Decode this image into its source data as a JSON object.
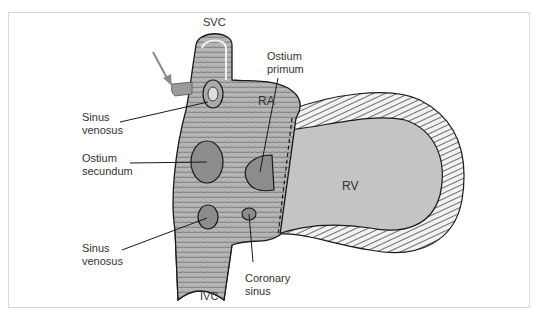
{
  "figure": {
    "colors": {
      "wall": "#b8b8b8",
      "wall_dark": "#9a9a9a",
      "rv": "#c4c4c4",
      "ostium": "#8c8c8c",
      "outline": "#1a1a1a",
      "arrow": "#8a8a8a",
      "frame": "#d8d8d8"
    }
  },
  "labels": {
    "svc": "SVC",
    "ivc": "IVC",
    "ra": "RA",
    "rv": "RV",
    "ostium_primum_1": "Ostium",
    "ostium_primum_2": "primum",
    "sinus_venosus_upper_1": "Sinus",
    "sinus_venosus_upper_2": "venosus",
    "ostium_secundum_1": "Ostium",
    "ostium_secundum_2": "secundum",
    "sinus_venosus_lower_1": "Sinus",
    "sinus_venosus_lower_2": "venosus",
    "coronary_sinus_1": "Coronary",
    "coronary_sinus_2": "sinus"
  }
}
